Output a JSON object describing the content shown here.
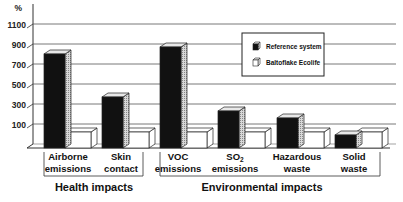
{
  "chart_data": {
    "type": "bar",
    "style": "3d-grouped",
    "title": "",
    "xlabel": "",
    "ylabel": "%",
    "ylim": [
      0,
      1150
    ],
    "yticks": [
      100,
      300,
      500,
      700,
      900,
      1100
    ],
    "grid": true,
    "legend_position": "upper-right-inside",
    "categories": [
      {
        "line1": "Airborne",
        "line2": "emissions",
        "group": "Health impacts"
      },
      {
        "line1": "Skin",
        "line2": "contact",
        "group": "Health impacts"
      },
      {
        "line1": "VOC",
        "line2": "emissions",
        "group": "Environmental impacts"
      },
      {
        "line1": "SO₂",
        "line2": "emissions",
        "group": "Environmental impacts"
      },
      {
        "line1": "Hazardous",
        "line2": "waste",
        "group": "Environmental impacts"
      },
      {
        "line1": "Solid",
        "line2": "waste",
        "group": "Environmental impacts"
      }
    ],
    "groups": [
      "Health impacts",
      "Environmental impacts"
    ],
    "series": [
      {
        "name": "Reference system",
        "color": "#111111",
        "values": [
          840,
          410,
          910,
          270,
          200,
          30
        ]
      },
      {
        "name": "Baltoflake Ecolife",
        "color": "#ffffff",
        "values": [
          100,
          100,
          100,
          100,
          100,
          100
        ]
      }
    ]
  },
  "axis": {
    "unit_label": "%"
  },
  "legend": {
    "items": [
      "Reference system",
      "Baltoflake Ecolife"
    ]
  },
  "groups": {
    "health": "Health impacts",
    "environmental": "Environmental impacts"
  }
}
